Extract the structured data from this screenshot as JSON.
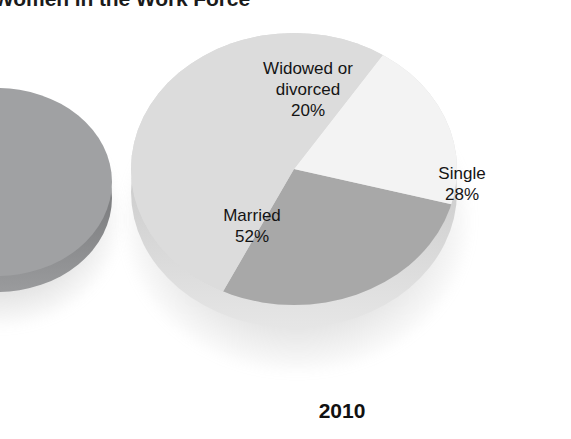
{
  "figure": {
    "title_partial": "Women in the Work Force",
    "year_caption": "2010"
  },
  "colors": {
    "background": "#ffffff",
    "text": "#141414",
    "married_slice": "#dcdcdc",
    "single_slice": "#a8a8a8",
    "widowed_slice": "#f3f3f3",
    "left_pie": "#a0a1a3",
    "pie_edge": "#cfcfcf"
  },
  "chart_data": {
    "type": "pie",
    "title": "Women in the Work Force",
    "subtitle": "2010",
    "categories": [
      "Single",
      "Widowed or divorced",
      "Married"
    ],
    "values": [
      28,
      20,
      52
    ],
    "unit": "%",
    "labels": [
      {
        "name": "Widowed or\ndivorced",
        "value": "20%",
        "color": "#f3f3f3"
      },
      {
        "name": "Single",
        "value": "28%",
        "color": "#a8a8a8"
      },
      {
        "name": "Married",
        "value": "52%",
        "color": "#dcdcdc"
      }
    ],
    "label_texts": {
      "widowed": "Widowed or\ndivorced\n20%",
      "single": "Single\n28%",
      "married": "Married\n52%"
    },
    "legend": "none",
    "grid": false,
    "three_d": true,
    "start_angle_deg": 33,
    "direction": "clockwise"
  },
  "secondary_chart": {
    "type": "pie",
    "visible": "partially cropped at left edge",
    "title": "",
    "categories": [],
    "values": []
  }
}
